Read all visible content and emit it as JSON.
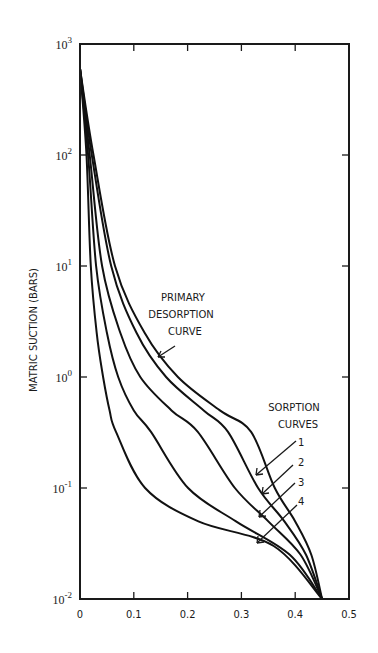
{
  "chart_data": {
    "type": "line",
    "title": "",
    "xlabel": "",
    "ylabel": "MATRIC SUCTION (BARS)",
    "xlim": [
      0,
      0.5
    ],
    "ylim": [
      0.01,
      1000
    ],
    "yscale": "log",
    "grid": false,
    "legend": "none (inline annotations)",
    "x_ticks": [
      "0",
      "0.1",
      "0.2",
      "0.3",
      "0.4",
      "0.5"
    ],
    "y_ticks": [
      {
        "value": 1000,
        "base": "10",
        "exp": "3"
      },
      {
        "value": 100,
        "base": "10",
        "exp": "2"
      },
      {
        "value": 10,
        "base": "10",
        "exp": "1"
      },
      {
        "value": 1,
        "base": "10",
        "exp": "0"
      },
      {
        "value": 0.1,
        "base": "10",
        "exp": "-1"
      },
      {
        "value": 0.01,
        "base": "10",
        "exp": "-2"
      }
    ],
    "series": [
      {
        "name": "Primary desorption curve",
        "x": [
          0.0,
          0.025,
          0.065,
          0.12,
          0.182,
          0.26,
          0.318,
          0.362,
          0.4,
          0.43,
          0.45
        ],
        "y": [
          600,
          100,
          10,
          2.5,
          1.0,
          0.5,
          0.32,
          0.1,
          0.05,
          0.025,
          0.01
        ]
      },
      {
        "name": "Sorption curve 1",
        "x": [
          0.0,
          0.022,
          0.058,
          0.105,
          0.16,
          0.23,
          0.275,
          0.331,
          0.38,
          0.42,
          0.45
        ],
        "y": [
          600,
          100,
          10,
          2.5,
          1.0,
          0.5,
          0.32,
          0.1,
          0.05,
          0.025,
          0.01
        ]
      },
      {
        "name": "Sorption curve 2",
        "x": [
          0.0,
          0.018,
          0.041,
          0.075,
          0.112,
          0.17,
          0.219,
          0.288,
          0.35,
          0.41,
          0.45
        ],
        "y": [
          600,
          100,
          10,
          2.5,
          1.0,
          0.5,
          0.32,
          0.1,
          0.05,
          0.025,
          0.01
        ]
      },
      {
        "name": "Sorption curve 3",
        "x": [
          0.0,
          0.015,
          0.03,
          0.05,
          0.071,
          0.1,
          0.132,
          0.201,
          0.29,
          0.39,
          0.45
        ],
        "y": [
          600,
          100,
          10,
          2.5,
          1.0,
          0.5,
          0.32,
          0.1,
          0.05,
          0.025,
          0.01
        ]
      },
      {
        "name": "Sorption curve 4",
        "x": [
          0.0,
          0.012,
          0.02,
          0.031,
          0.043,
          0.055,
          0.067,
          0.121,
          0.22,
          0.36,
          0.45
        ],
        "y": [
          600,
          100,
          10,
          2.5,
          1.0,
          0.5,
          0.32,
          0.1,
          0.05,
          0.03,
          0.01
        ]
      }
    ],
    "annotations": [
      {
        "text_lines": [
          "PRIMARY",
          "DESORPTION",
          "CURVE"
        ],
        "points_to": "Primary desorption curve"
      },
      {
        "text_lines": [
          "SORPTION",
          "CURVES"
        ],
        "points_to": "Sorption curves 1-4"
      },
      {
        "text": "1",
        "points_to": "Sorption curve 1"
      },
      {
        "text": "2",
        "points_to": "Sorption curve 2"
      },
      {
        "text": "3",
        "points_to": "Sorption curve 3"
      },
      {
        "text": "4",
        "points_to": "Sorption curve 4"
      }
    ]
  },
  "labels": {
    "ylabel": "MATRIC SUCTION (BARS)",
    "primary": [
      "PRIMARY",
      "DESORPTION",
      "CURVE"
    ],
    "sorption": [
      "SORPTION",
      "CURVES"
    ],
    "numbers": [
      "1",
      "2",
      "3",
      "4"
    ]
  },
  "layout": {
    "plot": {
      "left": 80,
      "right": 349,
      "top": 44,
      "bottom": 599
    },
    "colors": {
      "ink": "#1a1a1a",
      "background": "#ffffff"
    }
  }
}
